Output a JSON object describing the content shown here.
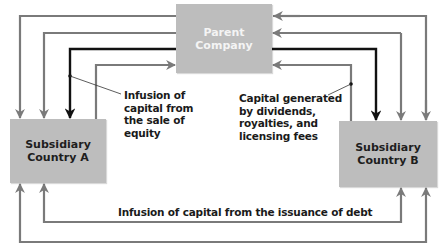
{
  "diagram": {
    "type": "capital-flow",
    "nodes": {
      "parent": {
        "line1": "Parent",
        "line2": "Company"
      },
      "subsidiary_a": {
        "line1": "Subsidiary",
        "line2": "Country A"
      },
      "subsidiary_b": {
        "line1": "Subsidiary",
        "line2": "Country B"
      }
    },
    "labels": {
      "equity": [
        "Infusion of",
        "capital from",
        "the sale of",
        "equity"
      ],
      "dividends": [
        "Capital generated",
        "by dividends,",
        "royalties, and",
        "licensing fees"
      ],
      "debt": "Infusion of capital from the issuance of debt"
    },
    "colors": {
      "box_fill": "#bdbdbd",
      "gray_line": "#7a7a7a",
      "black_line": "#111111",
      "parent_text": "#f4f4f4",
      "subsidiary_text": "#1e1e1e"
    },
    "edges": [
      {
        "from": "Subsidiary Country A",
        "to": "Parent Company",
        "style": "gray"
      },
      {
        "from": "Parent Company",
        "to": "Subsidiary Country A",
        "style": "gray"
      },
      {
        "from": "Parent Company",
        "to": "Subsidiary Country A",
        "style": "black",
        "label": "Infusion of capital from the sale of equity"
      },
      {
        "from": "Subsidiary Country A",
        "to": "Parent Company",
        "style": "gray",
        "label": "Capital generated by dividends, royalties, and licensing fees"
      },
      {
        "from": "Subsidiary Country B",
        "to": "Parent Company",
        "style": "gray"
      },
      {
        "from": "Parent Company",
        "to": "Subsidiary Country B",
        "style": "gray"
      },
      {
        "from": "Parent Company",
        "to": "Subsidiary Country B",
        "style": "black"
      },
      {
        "from": "Subsidiary Country B",
        "to": "Parent Company",
        "style": "gray"
      },
      {
        "from": "Subsidiary Country A",
        "to": "Subsidiary Country B",
        "style": "gray",
        "label": "Infusion of capital from the issuance of debt"
      },
      {
        "from": "Subsidiary Country B",
        "to": "Subsidiary Country A",
        "style": "gray"
      }
    ]
  }
}
